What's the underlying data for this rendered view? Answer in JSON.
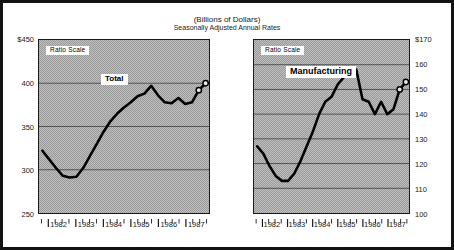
{
  "header": {
    "units_title": "(Billions of Dollars)",
    "subtitle": "Seasonally Adjusted Annual Rates"
  },
  "chart_data": [
    {
      "type": "line",
      "id": "total",
      "title": "Total",
      "scale_note": "Ratio Scale",
      "xlabel": "",
      "ylabel": "",
      "ylim": [
        250,
        450
      ],
      "yticks": [
        250,
        300,
        350,
        400,
        450
      ],
      "ytick_labels": [
        "250",
        "300",
        "350",
        "400",
        "$450"
      ],
      "y_axis_side": "left",
      "grid": true,
      "legend": "none",
      "xticks": [
        1982,
        1983,
        1984,
        1985,
        1986,
        1987
      ],
      "xtick_labels": [
        "1982",
        "1983",
        "1984",
        "1985",
        "1986",
        "1987"
      ],
      "x": [
        1981.75,
        1982.0,
        1982.25,
        1982.5,
        1982.75,
        1983.0,
        1983.25,
        1983.5,
        1983.75,
        1984.0,
        1984.25,
        1984.5,
        1984.75,
        1985.0,
        1985.25,
        1985.5,
        1985.75,
        1986.0,
        1986.25,
        1986.5,
        1986.75,
        1987.0,
        1987.25,
        1987.5,
        1987.75
      ],
      "values": [
        322,
        312,
        302,
        293,
        291,
        292,
        302,
        316,
        330,
        344,
        356,
        365,
        372,
        378,
        385,
        388,
        397,
        386,
        378,
        377,
        383,
        376,
        378,
        392,
        400
      ],
      "marker_points": [
        {
          "x": 1987.5,
          "y": 392,
          "style": "open-circle"
        },
        {
          "x": 1987.75,
          "y": 400,
          "style": "open-circle"
        }
      ]
    },
    {
      "type": "line",
      "id": "manufacturing",
      "title": "Manufacturing",
      "scale_note": "Ratio Scale",
      "xlabel": "",
      "ylabel": "",
      "ylim": [
        100,
        170
      ],
      "yticks": [
        100,
        110,
        120,
        130,
        140,
        150,
        160,
        170
      ],
      "ytick_labels": [
        "100",
        "110",
        "120",
        "130",
        "140",
        "150",
        "160",
        "$170"
      ],
      "y_axis_side": "right",
      "grid": true,
      "legend": "none",
      "xticks": [
        1982,
        1983,
        1984,
        1985,
        1986,
        1987
      ],
      "xtick_labels": [
        "1982",
        "1983",
        "1984",
        "1985",
        "1986",
        "1987"
      ],
      "x": [
        1981.75,
        1982.0,
        1982.25,
        1982.5,
        1982.75,
        1983.0,
        1983.25,
        1983.5,
        1983.75,
        1984.0,
        1984.25,
        1984.5,
        1984.75,
        1985.0,
        1985.25,
        1985.5,
        1985.75,
        1986.0,
        1986.25,
        1986.5,
        1986.75,
        1987.0,
        1987.25,
        1987.5,
        1987.75
      ],
      "values": [
        127,
        124,
        119,
        115,
        113,
        113,
        116,
        121,
        127,
        133,
        140,
        145,
        147,
        152,
        155,
        156,
        158,
        146,
        145,
        140,
        145,
        140,
        142,
        150,
        153
      ],
      "marker_points": [
        {
          "x": 1987.5,
          "y": 150,
          "style": "open-circle"
        },
        {
          "x": 1987.75,
          "y": 153,
          "style": "open-circle"
        }
      ]
    }
  ]
}
